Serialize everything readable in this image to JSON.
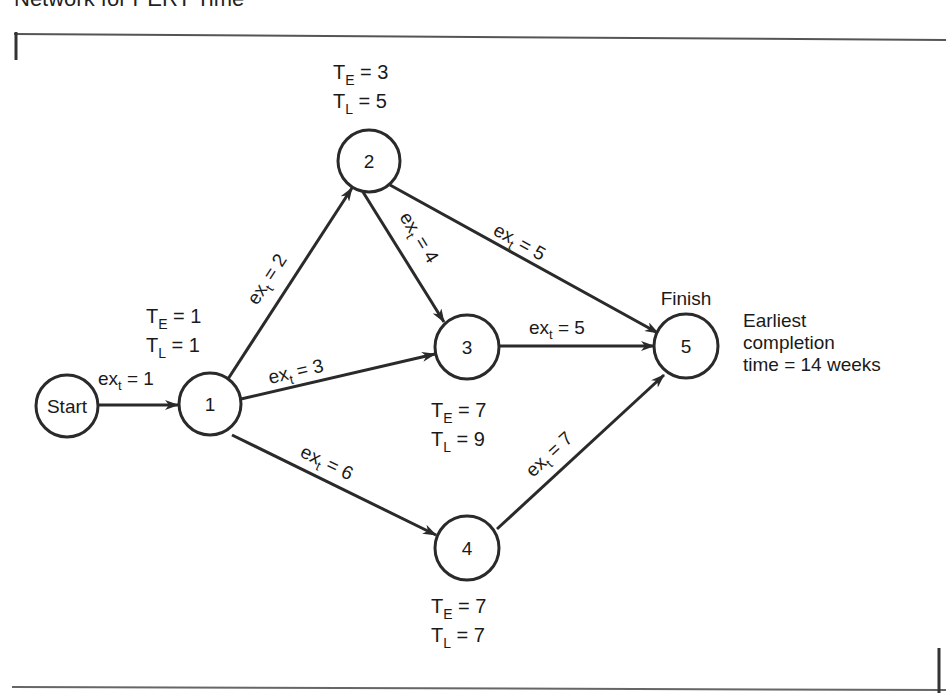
{
  "title": "Network for PERT Time",
  "nodes": {
    "start": {
      "label": "Start"
    },
    "n1": {
      "label": "1",
      "te": "1",
      "tl": "1"
    },
    "n2": {
      "label": "2",
      "te": "3",
      "tl": "5"
    },
    "n3": {
      "label": "3",
      "te": "7",
      "tl": "9"
    },
    "n4": {
      "label": "4",
      "te": "7",
      "tl": "7"
    },
    "n5": {
      "label": "5",
      "caption": "Finish"
    }
  },
  "edges": [
    {
      "from": "Start",
      "to": "1",
      "ext": "1"
    },
    {
      "from": "1",
      "to": "2",
      "ext": "2"
    },
    {
      "from": "1",
      "to": "3",
      "ext": "3"
    },
    {
      "from": "1",
      "to": "4",
      "ext": "6"
    },
    {
      "from": "2",
      "to": "3",
      "ext": "4"
    },
    {
      "from": "2",
      "to": "5",
      "ext": "5"
    },
    {
      "from": "3",
      "to": "5",
      "ext": "5"
    },
    {
      "from": "4",
      "to": "5",
      "ext": "7"
    }
  ],
  "labels": {
    "te_prefix": "T",
    "te_sub": "E",
    "tl_prefix": "T",
    "tl_sub": "L",
    "eq": " = ",
    "ex_prefix": "ex",
    "ex_sub": "t"
  },
  "completion": {
    "line1": "Earliest",
    "line2": "completion",
    "line3": "time = 14 weeks"
  }
}
